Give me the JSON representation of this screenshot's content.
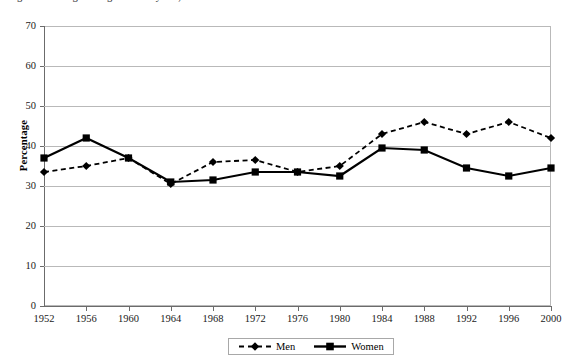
{
  "figure": {
    "title_fragment": "Figure 1. Voting and registration by sex, 1952-2000"
  },
  "legend": {
    "position": "bottom-center",
    "entries": [
      {
        "label": "Men",
        "marker": "diamond",
        "line": "dashed"
      },
      {
        "label": "Women",
        "marker": "square",
        "line": "solid"
      }
    ]
  },
  "axes": {
    "y_title": "Percentage",
    "y_ticks": [
      "0",
      "10",
      "20",
      "30",
      "40",
      "50",
      "60",
      "70"
    ],
    "x_ticks": [
      "1952",
      "1956",
      "1960",
      "1964",
      "1968",
      "1972",
      "1976",
      "1980",
      "1984",
      "1988",
      "1992",
      "1996",
      "2000"
    ]
  },
  "colors": {
    "series": "#000000",
    "grid": "#b9b9b9",
    "axis": "#6b6b6b",
    "background": "#ffffff"
  },
  "chart_data": {
    "type": "line",
    "title": "Figure 1. Voting and registration by sex, 1952-2000",
    "xlabel": "",
    "ylabel": "Percentage",
    "ylim": [
      0,
      70
    ],
    "ytick_step": 10,
    "grid": true,
    "legend_position": "bottom-center",
    "categories": [
      "1952",
      "1956",
      "1960",
      "1964",
      "1968",
      "1972",
      "1976",
      "1980",
      "1984",
      "1988",
      "1992",
      "1996",
      "2000"
    ],
    "series": [
      {
        "name": "Men",
        "marker": "diamond",
        "line_style": "dashed",
        "values": [
          33.5,
          35.0,
          37.0,
          30.5,
          36.0,
          36.5,
          33.5,
          35.0,
          43.0,
          46.0,
          43.0,
          46.0,
          42.0
        ]
      },
      {
        "name": "Women",
        "marker": "square",
        "line_style": "solid",
        "values": [
          37.0,
          42.0,
          37.0,
          31.0,
          31.5,
          33.5,
          33.5,
          32.5,
          39.5,
          39.0,
          34.5,
          32.5,
          34.5
        ]
      }
    ]
  }
}
